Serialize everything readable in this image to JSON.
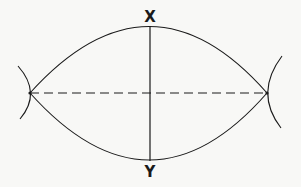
{
  "diagram": {
    "type": "geometric-construction",
    "labels": {
      "top": "X",
      "bottom": "Y"
    },
    "colors": {
      "stroke": "#1a1a1a",
      "background": "#f8f8f6"
    },
    "points": {
      "left_intersection": [
        30,
        93
      ],
      "right_intersection": [
        267,
        93
      ],
      "top": [
        150,
        26
      ],
      "bottom": [
        150,
        160
      ]
    }
  }
}
